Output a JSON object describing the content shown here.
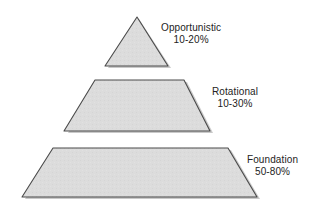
{
  "diagram": {
    "type": "pyramid",
    "title": "",
    "background_color": "#ffffff",
    "shape_fill_color": "#dcdcdc",
    "shape_stroke_color": "#4a4a4a",
    "shadow_color": "#c8c8c8",
    "text_color": "#232323",
    "tiers": [
      {
        "id": "opportunistic",
        "name": "Opportunistic",
        "value": "10-20%",
        "range_min_percent": 10,
        "range_max_percent": 20,
        "level": 1,
        "shape": "triangle"
      },
      {
        "id": "rotational",
        "name": "Rotational",
        "value": "10-30%",
        "range_min_percent": 10,
        "range_max_percent": 30,
        "level": 2,
        "shape": "trapezoid"
      },
      {
        "id": "foundation",
        "name": "Foundation",
        "value": "50-80%",
        "range_min_percent": 50,
        "range_max_percent": 80,
        "level": 3,
        "shape": "trapezoid"
      }
    ]
  }
}
